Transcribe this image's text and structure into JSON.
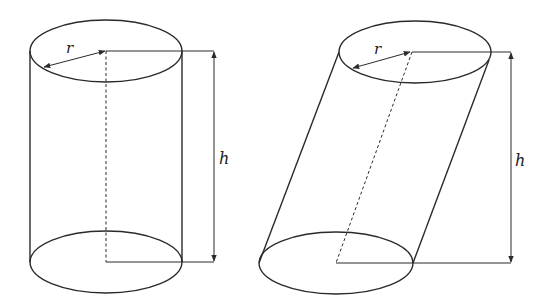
{
  "figure": {
    "background": "#ffffff",
    "line_color": "#2a2a2a"
  },
  "cylinders": [
    {
      "name": "right-cylinder",
      "type": "right",
      "top_ellipse": {
        "cx": 106,
        "cy": 51,
        "rx": 76,
        "ry": 31
      },
      "bottom_ellipse": {
        "cx": 106,
        "cy": 262,
        "rx": 76,
        "ry": 31
      },
      "axis_dashed": {
        "x1": 106,
        "y1": 51,
        "x2": 106,
        "y2": 262
      },
      "height_marker_x": 214,
      "radius_arrow": {
        "x1": 106,
        "y1": 51,
        "x2": 43,
        "y2": 67
      },
      "labels": {
        "radius": "r",
        "height": "h"
      },
      "label_positions": {
        "radius": {
          "x": 66,
          "y": 52
        },
        "height": {
          "x": 219,
          "y": 163
        }
      }
    },
    {
      "name": "oblique-cylinder",
      "type": "oblique",
      "top_ellipse": {
        "cx": 415,
        "cy": 52,
        "rx": 76,
        "ry": 31
      },
      "bottom_ellipse": {
        "cx": 336,
        "cy": 263,
        "rx": 77,
        "ry": 31
      },
      "axis_dashed": {
        "x1": 412,
        "y1": 52,
        "x2": 336,
        "y2": 263
      },
      "height_marker_x": 511,
      "radius_arrow": {
        "x1": 411,
        "y1": 52,
        "x2": 352,
        "y2": 68
      },
      "labels": {
        "radius": "r",
        "height": "h"
      },
      "label_positions": {
        "radius": {
          "x": 374,
          "y": 53
        },
        "height": {
          "x": 515,
          "y": 165
        }
      }
    }
  ]
}
